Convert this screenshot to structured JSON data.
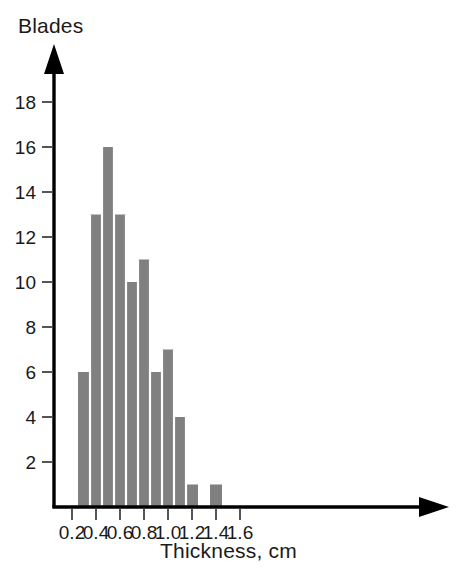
{
  "chart_data": {
    "type": "bar",
    "title": "",
    "subtitle": "",
    "xlabel": "Thickness, cm",
    "ylabel": "Blades",
    "grid": false,
    "legend": null,
    "bin_width": 0.1,
    "xlim": [
      0.1,
      1.8
    ],
    "ylim": [
      0,
      19
    ],
    "x_ticks": [
      "0.2",
      "0.4",
      "0.6",
      "0.8",
      "1.0",
      "1.2",
      "1.4",
      "1.6"
    ],
    "x_tick_values": [
      0.2,
      0.4,
      0.6,
      0.8,
      1.0,
      1.2,
      1.4,
      1.6
    ],
    "y_ticks": [
      "18",
      "16",
      "14",
      "12",
      "10",
      "8",
      "6",
      "4",
      "2"
    ],
    "y_tick_values": [
      18,
      16,
      14,
      12,
      10,
      8,
      6,
      4,
      2
    ],
    "bin_edges": [
      0.25,
      0.35,
      0.45,
      0.55,
      0.65,
      0.75,
      0.85,
      0.95,
      1.05,
      1.15,
      1.25,
      1.35,
      1.45
    ],
    "categories": [
      "0.25-0.35",
      "0.35-0.45",
      "0.45-0.55",
      "0.55-0.65",
      "0.65-0.75",
      "0.75-0.85",
      "0.85-0.95",
      "0.95-1.05",
      "1.05-1.15",
      "1.15-1.25",
      "1.25-1.35",
      "1.35-1.45"
    ],
    "values": [
      6,
      13,
      16,
      13,
      10,
      11,
      6,
      7,
      4,
      1,
      0,
      1
    ],
    "bar_color": "#808080",
    "bar_separator_color": "#ffffff",
    "axis_color": "#000000",
    "background_color": "#ffffff",
    "total_blades": 88
  }
}
